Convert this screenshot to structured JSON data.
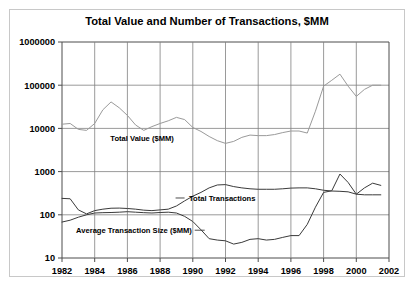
{
  "chart_data": {
    "type": "line",
    "title": "Total Value and Number of Transactions, $MM",
    "xlabel": "",
    "ylabel": "",
    "yscale": "log",
    "ylim": [
      10,
      1000000
    ],
    "xlim": [
      1982,
      2002
    ],
    "grid": true,
    "legend_position": "inline-labels",
    "ytick_labels": [
      "10",
      "100",
      "1000",
      "10000",
      "100000",
      "1000000"
    ],
    "ytick_values": [
      10,
      100,
      1000,
      10000,
      100000,
      1000000
    ],
    "xtick_labels": [
      "1982",
      "1984",
      "1986",
      "1988",
      "1990",
      "1992",
      "1994",
      "1996",
      "1998",
      "2000",
      "2002"
    ],
    "xtick_values": [
      1982,
      1984,
      1986,
      1988,
      1990,
      1992,
      1994,
      1996,
      1998,
      2000,
      2002
    ],
    "x": [
      1982,
      1982.5,
      1983,
      1983.5,
      1984,
      1984.5,
      1985,
      1985.5,
      1986,
      1986.5,
      1987,
      1987.5,
      1988,
      1988.5,
      1989,
      1989.5,
      1990,
      1990.5,
      1991,
      1991.5,
      1992,
      1992.5,
      1993,
      1993.5,
      1994,
      1994.5,
      1995,
      1995.5,
      1996,
      1996.5,
      1997,
      1997.5,
      1998,
      1998.5,
      1999,
      1999.5,
      2000,
      2000.5,
      2001,
      2001.5
    ],
    "series": [
      {
        "name": "Total Value ($MM)",
        "label": "Total Value ($MM)",
        "color": "#9a9a9a",
        "values": [
          12500,
          13000,
          9500,
          9000,
          13000,
          27000,
          41000,
          30000,
          20000,
          12000,
          9000,
          11000,
          13000,
          15000,
          18000,
          16000,
          10500,
          8500,
          6500,
          5200,
          4500,
          5000,
          6200,
          7000,
          6800,
          6800,
          7200,
          8000,
          8700,
          8700,
          7800,
          25000,
          95000,
          130000,
          180000,
          95000,
          55000,
          80000,
          100000,
          100000
        ]
      },
      {
        "name": "Total Transactions",
        "label": "Total Transactions",
        "color": "#3a3a3a",
        "values": [
          240,
          235,
          130,
          105,
          125,
          135,
          142,
          143,
          140,
          135,
          128,
          125,
          130,
          135,
          160,
          210,
          270,
          330,
          420,
          490,
          500,
          450,
          420,
          400,
          390,
          390,
          390,
          400,
          415,
          420,
          420,
          400,
          370,
          355,
          350,
          340,
          300,
          290,
          290,
          290
        ]
      },
      {
        "name": "Average Transaction Size ($MM)",
        "label": "Average Transaction Size ($MM)",
        "color": "#3a3a3a",
        "values": [
          68,
          75,
          88,
          100,
          110,
          112,
          113,
          115,
          118,
          115,
          112,
          110,
          113,
          115,
          110,
          92,
          70,
          45,
          28,
          26,
          25,
          21,
          23,
          27,
          28,
          26,
          27,
          30,
          33,
          33,
          60,
          150,
          330,
          360,
          880,
          560,
          300,
          420,
          540,
          480
        ]
      }
    ],
    "annotations": [
      {
        "text": "Total Value ($MM)",
        "x": 1986.9,
        "y": 6000,
        "leader": false
      },
      {
        "text": "Total Transactions",
        "x": 1991.8,
        "y": 245,
        "leader": true,
        "leader_side": "left"
      },
      {
        "text": "Average Transaction Size ($MM)",
        "x": 1986.4,
        "y": 44,
        "leader": true,
        "leader_side": "right"
      }
    ]
  },
  "style": {
    "background": "#ffffff",
    "border_color": "#c8c8c8",
    "grid_color": "#808080",
    "axis_color": "#4d4d4d"
  }
}
